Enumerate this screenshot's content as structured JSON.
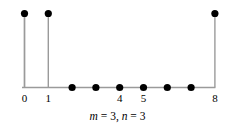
{
  "figure": {
    "caption": "m = 3, n = 3",
    "caption_parts": [
      {
        "text": "m",
        "italic": true
      },
      {
        "text": " = 3, ",
        "italic": false
      },
      {
        "text": "n",
        "italic": true
      },
      {
        "text": " = 3",
        "italic": false
      }
    ]
  },
  "colors": {
    "stem": "#9a9a9a",
    "axis": "#9a9a9a",
    "marker": "#000000",
    "text": "#000000",
    "background": "#ffffff"
  },
  "chart_data": {
    "type": "scatter",
    "title": "",
    "subtitle": "",
    "xlabel": "",
    "ylabel": "",
    "plot_style": "stem",
    "x": [
      0,
      1,
      2,
      3,
      4,
      5,
      6,
      7,
      8
    ],
    "values": [
      1,
      1,
      0,
      0,
      0,
      0,
      0,
      0,
      1
    ],
    "xlim": [
      0,
      8
    ],
    "ylim": [
      0,
      1
    ],
    "xticks": [
      0,
      1,
      4,
      5,
      8
    ],
    "xtick_labels": [
      "0",
      "1",
      "4",
      "5",
      "8"
    ],
    "yticks": [],
    "ytick_labels": [],
    "grid": false,
    "legend": null,
    "annotations": [
      "m = 3, n = 3"
    ]
  }
}
